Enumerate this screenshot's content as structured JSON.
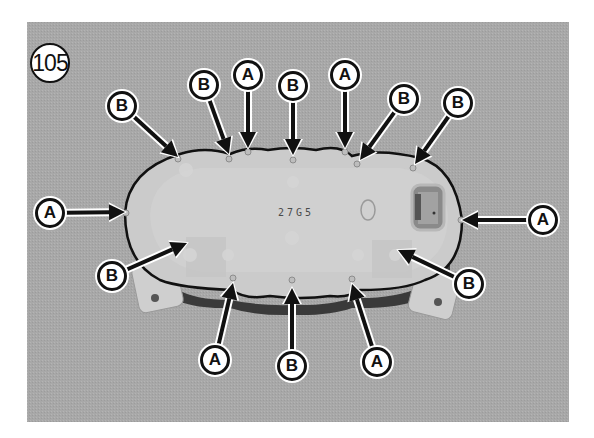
{
  "figure": {
    "number": "105",
    "background_color": "#a9a9a9",
    "housing_color": "#c9c9c9",
    "outline_color": "#111111",
    "part_stamp": "27G5"
  },
  "legend": {
    "A": "A",
    "B": "B"
  },
  "callouts": [
    {
      "label": "B",
      "cx": 122,
      "cy": 106,
      "tip": [
        178,
        157
      ]
    },
    {
      "label": "B",
      "cx": 204,
      "cy": 85,
      "tip": [
        229,
        154
      ]
    },
    {
      "label": "A",
      "cx": 248,
      "cy": 75,
      "tip": [
        248,
        148
      ]
    },
    {
      "label": "B",
      "cx": 293,
      "cy": 86,
      "tip": [
        293,
        155
      ]
    },
    {
      "label": "A",
      "cx": 345,
      "cy": 75,
      "tip": [
        345,
        148
      ]
    },
    {
      "label": "B",
      "cx": 404,
      "cy": 99,
      "tip": [
        360,
        160
      ]
    },
    {
      "label": "B",
      "cx": 458,
      "cy": 103,
      "tip": [
        415,
        164
      ]
    },
    {
      "label": "A",
      "cx": 50,
      "cy": 213,
      "tip": [
        125,
        212
      ]
    },
    {
      "label": "A",
      "cx": 543,
      "cy": 220,
      "tip": [
        462,
        220
      ]
    },
    {
      "label": "B",
      "cx": 112,
      "cy": 276,
      "tip": [
        187,
        243
      ]
    },
    {
      "label": "B",
      "cx": 469,
      "cy": 284,
      "tip": [
        398,
        250
      ]
    },
    {
      "label": "A",
      "cx": 215,
      "cy": 360,
      "tip": [
        233,
        283
      ]
    },
    {
      "label": "B",
      "cx": 292,
      "cy": 366,
      "tip": [
        292,
        288
      ]
    },
    {
      "label": "A",
      "cx": 377,
      "cy": 362,
      "tip": [
        352,
        284
      ]
    }
  ]
}
